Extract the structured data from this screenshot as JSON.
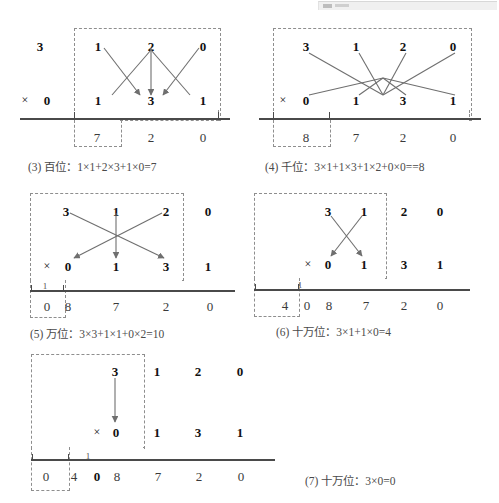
{
  "figure": {
    "title_visible": false,
    "panels": [
      {
        "id": "panel-3",
        "label": "(3)",
        "place_name": "百位",
        "caption": "(3) 百位：1×1+2×3+1×0=7",
        "equation": "1×1+2×3+1×0=7",
        "result_digit": "7",
        "multiplicand_outside": [
          "3"
        ],
        "multiplicand_active": [
          "1",
          "2",
          "0"
        ],
        "times_symbol": "×",
        "multiplier_outside": [
          "0"
        ],
        "multiplier_active": [
          "1",
          "3",
          "1"
        ],
        "result_row": [
          "7",
          "2",
          "0"
        ],
        "carry": "",
        "arrow_style": "three-arrows-crossing"
      },
      {
        "id": "panel-4",
        "label": "(4)",
        "place_name": "千位",
        "caption": "(4) 千位：3×1+1×3+1×2+0×0==8",
        "equation": "3×1+1×3+1×2+0×0==8",
        "result_digit": "8",
        "multiplicand_outside": [],
        "multiplicand_active": [
          "3",
          "1",
          "2",
          "0"
        ],
        "times_symbol": "×",
        "multiplier_outside": [],
        "multiplier_active": [
          "0",
          "1",
          "3",
          "1"
        ],
        "result_row": [
          "8",
          "7",
          "2",
          "0"
        ],
        "carry": "",
        "arrow_style": "four-lines-crossing"
      },
      {
        "id": "panel-5",
        "label": "(5)",
        "place_name": "万位",
        "caption": "(5) 万位：3×3+1×1+0×2=10",
        "equation": "3×3+1×1+0×2=10",
        "result_digit": "0",
        "multiplicand_outside": [
          "0"
        ],
        "multiplicand_active": [
          "3",
          "1",
          "2"
        ],
        "times_symbol": "×",
        "multiplier_outside": [
          "1"
        ],
        "multiplier_active": [
          "0",
          "1",
          "3"
        ],
        "result_row": [
          "0",
          "8",
          "7",
          "2",
          "0"
        ],
        "carry": "1",
        "arrow_style": "three-arrows-crossing"
      },
      {
        "id": "panel-6",
        "label": "(6)",
        "place_name": "十万位",
        "caption": "(6) 十万位：3×1+1×0=4",
        "equation": "3×1+1×0=4",
        "result_digit": "4",
        "multiplicand_outside": [
          "2",
          "0"
        ],
        "multiplicand_active": [
          "3",
          "1"
        ],
        "times_symbol": "×",
        "multiplier_outside": [
          "3",
          "1"
        ],
        "multiplier_active": [
          "0",
          "1"
        ],
        "result_row": [
          "4",
          "0",
          "8",
          "7",
          "2",
          "0"
        ],
        "carry": "",
        "arrow_style": "two-arrows-crossing"
      },
      {
        "id": "panel-7",
        "label": "(7)",
        "place_name": "十万位",
        "caption": "(7) 十万位：3×0=0",
        "equation": "3×0=0",
        "result_digit": "0",
        "multiplicand_outside": [
          "1",
          "2",
          "0"
        ],
        "multiplicand_active": [
          "3"
        ],
        "times_symbol": "×",
        "multiplier_outside": [
          "1",
          "3",
          "1"
        ],
        "multiplier_active": [
          "0"
        ],
        "result_row": [
          "0",
          "4",
          "0",
          "8",
          "7",
          "2",
          "0"
        ],
        "carry": "1",
        "arrow_style": "single-down-arrow"
      }
    ]
  },
  "p3": {
    "top": {
      "out0": "3",
      "a0": "1",
      "a1": "2",
      "a2": "0"
    },
    "mid": {
      "times": "×",
      "out0": "0",
      "b0": "1",
      "b1": "3",
      "b2": "1"
    },
    "res": {
      "r0": "7",
      "r1": "2",
      "r2": "0"
    },
    "caption": "(3) 百位：1×1+2×3+1×0=7"
  },
  "p4": {
    "top": {
      "a0": "3",
      "a1": "1",
      "a2": "2",
      "a3": "0"
    },
    "mid": {
      "times": "×",
      "b0": "0",
      "b1": "1",
      "b2": "3",
      "b3": "1"
    },
    "res": {
      "r0": "8",
      "r1": "7",
      "r2": "2",
      "r3": "0"
    },
    "caption": "(4) 千位：3×1+1×3+1×2+0×0==8"
  },
  "p5": {
    "top": {
      "a0": "3",
      "a1": "1",
      "a2": "2",
      "out0": "0"
    },
    "mid": {
      "times": "×",
      "b0": "0",
      "b1": "1",
      "b2": "3",
      "out0": "1"
    },
    "res": {
      "carry": "1",
      "r0": "0",
      "r1": "8",
      "r2": "7",
      "r3": "2",
      "r4": "0"
    },
    "caption": "(5) 万位：3×3+1×1+0×2=10"
  },
  "p6": {
    "top": {
      "a0": "3",
      "a1": "1",
      "out0": "2",
      "out1": "0"
    },
    "mid": {
      "times": "×",
      "b0": "0",
      "b1": "1",
      "out0": "3",
      "out1": "1"
    },
    "res": {
      "carry": "1",
      "r0": "4",
      "r1": "0",
      "r2": "8",
      "r3": "7",
      "r4": "2",
      "r5": "0"
    },
    "caption": "(6) 十万位：3×1+1×0=4"
  },
  "p7": {
    "top": {
      "a0": "3",
      "out0": "1",
      "out1": "2",
      "out2": "0"
    },
    "mid": {
      "times": "×",
      "b0": "0",
      "out0": "1",
      "out1": "3",
      "out2": "1"
    },
    "res": {
      "carry": "1",
      "r0": "0",
      "r1": "4",
      "r2": "0",
      "r3": "8",
      "r4": "7",
      "r5": "2",
      "r6": "0"
    },
    "caption": "(7) 十万位：3×0=0"
  },
  "colors": {
    "ink": "#111111",
    "rule": "#4a4a4a",
    "dashed_box": "#8e8e8e",
    "arrow": "#6f6f6f",
    "caption": "#4a4a4a",
    "faint_digit": "#555555"
  }
}
